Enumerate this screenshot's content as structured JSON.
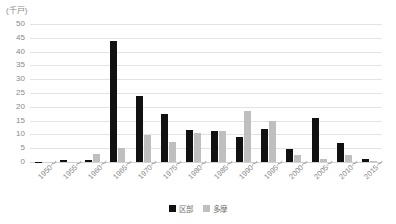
{
  "chart_data": {
    "type": "bar",
    "title": "",
    "subtitle": "",
    "unit_label": "(千戸)",
    "xlabel": "",
    "ylabel": "",
    "ylim": [
      0,
      50
    ],
    "ytick_step": 5,
    "yticks": [
      "50",
      "45",
      "40",
      "35",
      "30",
      "25",
      "20",
      "15",
      "10",
      "5",
      "0"
    ],
    "grid": true,
    "legend_position": "bottom-center",
    "categories": [
      "1950～",
      "1955～",
      "1960～",
      "1965～",
      "1970～",
      "1975～",
      "1980～",
      "1985～",
      "1990～",
      "1995～",
      "2000～",
      "2005～",
      "2010～",
      "2015～"
    ],
    "series": [
      {
        "name": "区部",
        "color": "#111111",
        "values": [
          0.1,
          0.6,
          0.7,
          44.0,
          24.0,
          17.3,
          11.7,
          11.4,
          9.0,
          11.8,
          4.8,
          16.0,
          6.9,
          1.2
        ]
      },
      {
        "name": "多摩",
        "color": "#bfbfbf",
        "values": [
          0.0,
          0.0,
          3.0,
          5.2,
          9.8,
          7.2,
          10.6,
          11.4,
          18.5,
          14.9,
          2.7,
          1.0,
          2.7,
          0.2
        ]
      }
    ]
  },
  "legend": {
    "items": [
      {
        "label": "区部",
        "swatch": "black-square-icon"
      },
      {
        "label": "多摩",
        "swatch": "gray-square-icon"
      }
    ]
  }
}
